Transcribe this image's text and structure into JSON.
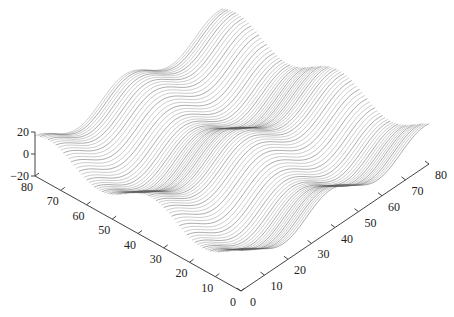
{
  "chart_data": {
    "type": "surface-waterfall",
    "title": "",
    "xlabel": "",
    "ylabel": "",
    "zlabel": "",
    "left_axis": {
      "ticks": [
        0,
        10,
        20,
        30,
        40,
        50,
        60,
        70,
        80
      ],
      "range": [
        0,
        80
      ]
    },
    "right_axis": {
      "ticks": [
        0,
        10,
        20,
        30,
        40,
        50,
        60,
        70,
        80
      ],
      "range": [
        0,
        80
      ]
    },
    "z_axis": {
      "ticks": [
        -20,
        0,
        20
      ],
      "range": [
        -20,
        20
      ]
    },
    "grid": false,
    "line_color": "#555555",
    "line_count": 80,
    "surface_model": "z = -10*cos(2*pi*(L-15)/40) - 10*cos(2*pi*(R-18)/40)",
    "troughs": [
      {
        "left": 16,
        "right": 18,
        "z": -20
      },
      {
        "left": 55,
        "right": 18,
        "z": -20
      },
      {
        "left": 14,
        "right": 59,
        "z": -20
      },
      {
        "left": 54,
        "right": 58,
        "z": -20
      }
    ],
    "amplitude": 20,
    "period": 40
  },
  "labels": {
    "left_ticks": [
      "0",
      "10",
      "20",
      "30",
      "40",
      "50",
      "60",
      "70",
      "80"
    ],
    "right_ticks": [
      "0",
      "10",
      "20",
      "30",
      "40",
      "50",
      "60",
      "70",
      "80"
    ],
    "z_ticks": [
      "-20",
      "0",
      "20"
    ]
  }
}
